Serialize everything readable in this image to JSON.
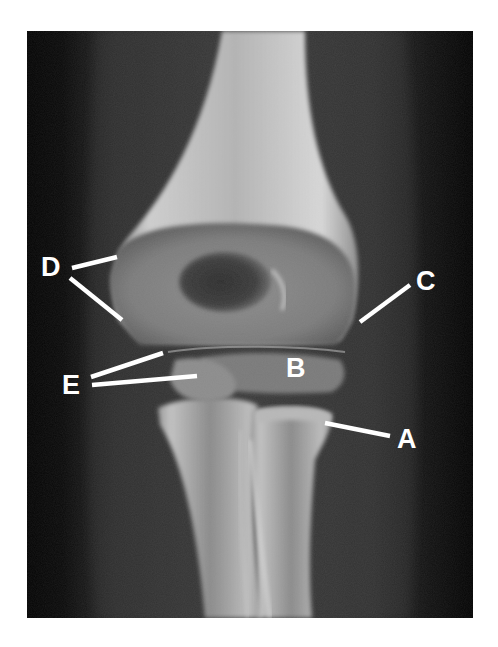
{
  "figure": {
    "type": "radiograph",
    "background_color": "#ffffff",
    "image_bg_color": "#050505",
    "label_color": "#ffffff"
  },
  "labels": [
    {
      "id": "A",
      "text": "A",
      "x": 397,
      "y": 426,
      "pointer": [
        [
          325,
          423
        ],
        [
          390,
          436
        ]
      ]
    },
    {
      "id": "B",
      "text": "B",
      "x": 286,
      "y": 355,
      "pointer": []
    },
    {
      "id": "C",
      "text": "C",
      "x": 416,
      "y": 268,
      "pointer": [
        [
          410,
          285
        ],
        [
          360,
          322
        ]
      ]
    },
    {
      "id": "D",
      "text": "D",
      "x": 41,
      "y": 254,
      "pointer": [
        [
          72,
          268
        ],
        [
          117,
          257
        ],
        [
          70,
          278
        ],
        [
          122,
          320
        ]
      ]
    },
    {
      "id": "E",
      "text": "E",
      "x": 62,
      "y": 372,
      "pointer": [
        [
          91,
          377
        ],
        [
          163,
          353
        ],
        [
          92,
          385
        ],
        [
          197,
          376
        ]
      ]
    }
  ]
}
